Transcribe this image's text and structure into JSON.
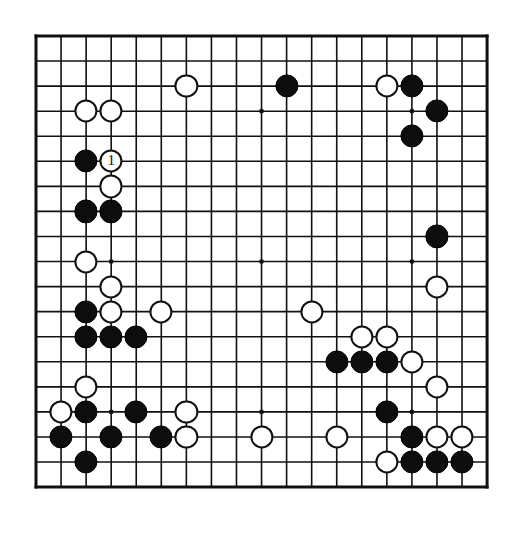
{
  "page": {
    "kind": "go-board-diagram",
    "background_color": "#ffffff",
    "ink_color": "#111111"
  },
  "board": {
    "name": "go-board",
    "size": 19,
    "columns": 19,
    "rows": 19,
    "line_color": "#111111",
    "border_width_px": 3,
    "line_width_px": 1.6,
    "cell_px": 25.06,
    "origin_x_px": 10,
    "origin_y_px": 10,
    "stone_radius_px": 11.6,
    "star_points": [
      [
        3,
        3
      ],
      [
        9,
        3
      ],
      [
        15,
        3
      ],
      [
        3,
        9
      ],
      [
        9,
        9
      ],
      [
        15,
        9
      ],
      [
        3,
        15
      ],
      [
        9,
        15
      ],
      [
        15,
        15
      ]
    ],
    "star_radius_px": 2.4
  },
  "stones": {
    "black_color": "#0d0d0d",
    "white_color": "#ffffff",
    "list": [
      {
        "color": "black",
        "col": 10,
        "row": 2,
        "label": ""
      },
      {
        "color": "white",
        "col": 6,
        "row": 2,
        "label": ""
      },
      {
        "color": "white",
        "col": 14,
        "row": 2,
        "label": ""
      },
      {
        "color": "black",
        "col": 15,
        "row": 2,
        "label": ""
      },
      {
        "color": "black",
        "col": 16,
        "row": 3,
        "label": ""
      },
      {
        "color": "white",
        "col": 2,
        "row": 3,
        "label": ""
      },
      {
        "color": "white",
        "col": 3,
        "row": 3,
        "label": ""
      },
      {
        "color": "black",
        "col": 15,
        "row": 4,
        "label": ""
      },
      {
        "color": "black",
        "col": 2,
        "row": 5,
        "label": ""
      },
      {
        "color": "white",
        "col": 3,
        "row": 5,
        "label": "1"
      },
      {
        "color": "white",
        "col": 3,
        "row": 6,
        "label": ""
      },
      {
        "color": "black",
        "col": 2,
        "row": 7,
        "label": ""
      },
      {
        "color": "black",
        "col": 3,
        "row": 7,
        "label": ""
      },
      {
        "color": "black",
        "col": 16,
        "row": 8,
        "label": ""
      },
      {
        "color": "white",
        "col": 2,
        "row": 9,
        "label": ""
      },
      {
        "color": "white",
        "col": 16,
        "row": 10,
        "label": ""
      },
      {
        "color": "white",
        "col": 3,
        "row": 10,
        "label": ""
      },
      {
        "color": "black",
        "col": 2,
        "row": 11,
        "label": ""
      },
      {
        "color": "white",
        "col": 3,
        "row": 11,
        "label": ""
      },
      {
        "color": "white",
        "col": 5,
        "row": 11,
        "label": ""
      },
      {
        "color": "white",
        "col": 11,
        "row": 11,
        "label": ""
      },
      {
        "color": "black",
        "col": 2,
        "row": 12,
        "label": ""
      },
      {
        "color": "black",
        "col": 3,
        "row": 12,
        "label": ""
      },
      {
        "color": "black",
        "col": 4,
        "row": 12,
        "label": ""
      },
      {
        "color": "white",
        "col": 13,
        "row": 12,
        "label": ""
      },
      {
        "color": "white",
        "col": 14,
        "row": 12,
        "label": ""
      },
      {
        "color": "black",
        "col": 12,
        "row": 13,
        "label": ""
      },
      {
        "color": "black",
        "col": 13,
        "row": 13,
        "label": ""
      },
      {
        "color": "black",
        "col": 14,
        "row": 13,
        "label": ""
      },
      {
        "color": "white",
        "col": 15,
        "row": 13,
        "label": ""
      },
      {
        "color": "white",
        "col": 16,
        "row": 14,
        "label": ""
      },
      {
        "color": "white",
        "col": 2,
        "row": 14,
        "label": ""
      },
      {
        "color": "white",
        "col": 1,
        "row": 15,
        "label": ""
      },
      {
        "color": "black",
        "col": 2,
        "row": 15,
        "label": ""
      },
      {
        "color": "black",
        "col": 4,
        "row": 15,
        "label": ""
      },
      {
        "color": "white",
        "col": 6,
        "row": 15,
        "label": ""
      },
      {
        "color": "black",
        "col": 14,
        "row": 15,
        "label": ""
      },
      {
        "color": "black",
        "col": 1,
        "row": 16,
        "label": ""
      },
      {
        "color": "black",
        "col": 3,
        "row": 16,
        "label": ""
      },
      {
        "color": "black",
        "col": 5,
        "row": 16,
        "label": ""
      },
      {
        "color": "white",
        "col": 6,
        "row": 16,
        "label": ""
      },
      {
        "color": "white",
        "col": 9,
        "row": 16,
        "label": ""
      },
      {
        "color": "white",
        "col": 12,
        "row": 16,
        "label": ""
      },
      {
        "color": "black",
        "col": 15,
        "row": 16,
        "label": ""
      },
      {
        "color": "white",
        "col": 16,
        "row": 16,
        "label": ""
      },
      {
        "color": "white",
        "col": 17,
        "row": 16,
        "label": ""
      },
      {
        "color": "black",
        "col": 2,
        "row": 17,
        "label": ""
      },
      {
        "color": "white",
        "col": 14,
        "row": 17,
        "label": ""
      },
      {
        "color": "black",
        "col": 15,
        "row": 17,
        "label": ""
      },
      {
        "color": "black",
        "col": 16,
        "row": 17,
        "label": ""
      },
      {
        "color": "black",
        "col": 17,
        "row": 17,
        "label": ""
      }
    ]
  }
}
